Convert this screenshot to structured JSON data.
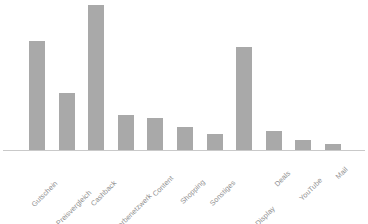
{
  "chart_data": {
    "type": "bar",
    "title": "",
    "subtitle": "",
    "xlabel": "",
    "ylabel": "",
    "grid": false,
    "legend": "none",
    "axis_line_color": "#c9c9c9",
    "bar_color": "#a9a9a9",
    "label_color": "#8e8e8e",
    "label_rotation_deg": -45,
    "ylim": [
      0,
      100
    ],
    "categories": [
      "Gutschein",
      "Preisvergleich",
      "Cashback",
      "Werbenetzwerk",
      "Content",
      "Shopping",
      "Sonstiges",
      "Performance-Display",
      "Deals",
      "YouTube",
      "Mail"
    ],
    "values": [
      75,
      39,
      100,
      24,
      22,
      16,
      11,
      71,
      13,
      7,
      4
    ]
  }
}
